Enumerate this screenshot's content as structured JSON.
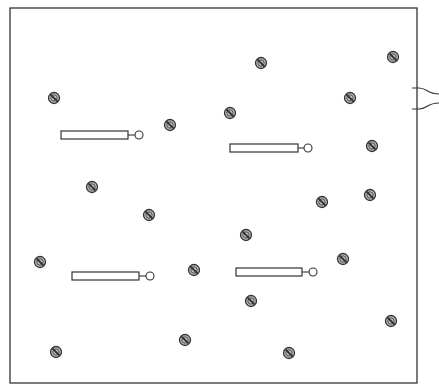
{
  "diagram": {
    "panel": {
      "x": 10,
      "y": 8,
      "width": 407,
      "height": 375,
      "stroke": "#333333"
    },
    "cable": {
      "exit_x": 417,
      "upper_y": 88,
      "lower_y": 109,
      "end_x": 439,
      "upper_end_y": 94,
      "lower_end_y": 103
    },
    "screws": [
      {
        "x": 54,
        "y": 98
      },
      {
        "x": 170,
        "y": 125
      },
      {
        "x": 261,
        "y": 63
      },
      {
        "x": 230,
        "y": 113
      },
      {
        "x": 393,
        "y": 57
      },
      {
        "x": 350,
        "y": 98
      },
      {
        "x": 372,
        "y": 146
      },
      {
        "x": 92,
        "y": 187
      },
      {
        "x": 149,
        "y": 215
      },
      {
        "x": 322,
        "y": 202
      },
      {
        "x": 370,
        "y": 195
      },
      {
        "x": 246,
        "y": 235
      },
      {
        "x": 40,
        "y": 262
      },
      {
        "x": 194,
        "y": 270
      },
      {
        "x": 343,
        "y": 259
      },
      {
        "x": 251,
        "y": 301
      },
      {
        "x": 391,
        "y": 321
      },
      {
        "x": 185,
        "y": 340
      },
      {
        "x": 56,
        "y": 352
      },
      {
        "x": 289,
        "y": 353
      }
    ],
    "probes": [
      {
        "x": 61,
        "y": 131,
        "width": 67,
        "height": 8,
        "tip_x": 139
      },
      {
        "x": 230,
        "y": 144,
        "width": 68,
        "height": 8,
        "tip_x": 308
      },
      {
        "x": 72,
        "y": 272,
        "width": 67,
        "height": 8,
        "tip_x": 150
      },
      {
        "x": 236,
        "y": 268,
        "width": 66,
        "height": 8,
        "tip_x": 313
      }
    ],
    "colors": {
      "line": "#333333",
      "screw_fill": "#bdbdbd",
      "screw_stroke": "#333333",
      "background": "#ffffff"
    }
  }
}
